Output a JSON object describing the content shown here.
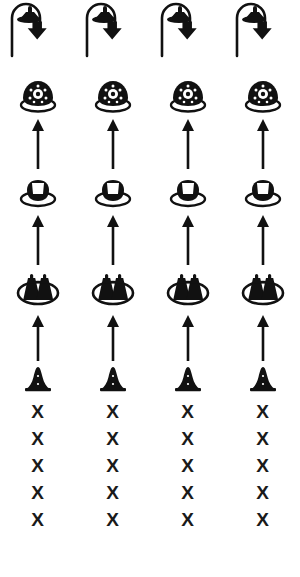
{
  "diagram": {
    "orientation": "bottom-to-top",
    "column_count": 4,
    "columns": [
      {
        "label": "column-1"
      },
      {
        "label": "column-2"
      },
      {
        "label": "column-3"
      },
      {
        "label": "column-4"
      }
    ],
    "rows": [
      {
        "id": "recycle",
        "icon": "dome-with-recycle-loop-arrow-icon",
        "label": ""
      },
      {
        "id": "stage-4",
        "icon": "textured-dome-on-base-icon",
        "label": ""
      },
      {
        "id": "arrow-3",
        "icon": "up-arrow-icon",
        "label": ""
      },
      {
        "id": "stage-3",
        "icon": "cup-on-oval-base-icon",
        "label": ""
      },
      {
        "id": "arrow-2",
        "icon": "up-arrow-icon",
        "label": ""
      },
      {
        "id": "stage-2",
        "icon": "two-figures-in-oval-icon",
        "label": ""
      },
      {
        "id": "arrow-1",
        "icon": "up-arrow-icon",
        "label": ""
      },
      {
        "id": "stage-1",
        "icon": "small-cone-icon",
        "label": ""
      },
      {
        "id": "marks",
        "icon": "x-mark-icon",
        "label": "X"
      }
    ],
    "x_marks": {
      "glyph": "X",
      "per_column_count": 5,
      "total_count": 20
    },
    "colors": {
      "ink": "#111111",
      "background": "#ffffff"
    }
  }
}
